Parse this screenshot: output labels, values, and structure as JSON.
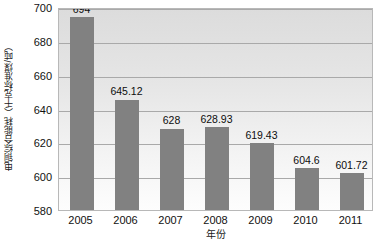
{
  "chart_data": {
    "type": "bar",
    "title": "",
    "subtitle": "",
    "xlabel": "年份",
    "ylabel": "电铜综合能耗（千克标准煤/吨）",
    "categories": [
      "2005",
      "2006",
      "2007",
      "2008",
      "2009",
      "2010",
      "2011"
    ],
    "values": [
      694,
      645.12,
      628,
      628.93,
      619.43,
      604.6,
      601.72
    ],
    "data_labels": [
      "694",
      "645.12",
      "628",
      "628.93",
      "619.43",
      "604.6",
      "601.72"
    ],
    "series": [
      {
        "name": "电铜综合能耗",
        "values": [
          694,
          645.12,
          628,
          628.93,
          619.43,
          604.6,
          601.72
        ]
      }
    ],
    "ylim": [
      580,
      700
    ],
    "yticks": [
      700,
      680,
      660,
      640,
      620,
      600,
      580
    ],
    "ytick_labels": [
      "700",
      "680",
      "660",
      "640",
      "620",
      "600",
      "580"
    ],
    "xtick_labels": [
      "2005",
      "2006",
      "2007",
      "2008",
      "2009",
      "2010",
      "2011"
    ],
    "grid": true,
    "grid_axis": "y",
    "legend": false,
    "legend_position": "none",
    "bar_color": "#818181",
    "plot_bg_top": "#dcdcdc",
    "plot_bg_bottom": "#fdfdfd",
    "gridline_color": "#a9a9a9",
    "border_color": "#b8b8b8",
    "text_color": "#111111"
  }
}
